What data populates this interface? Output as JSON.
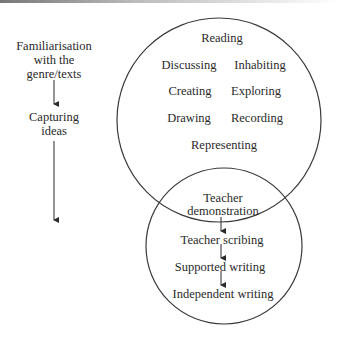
{
  "left_column": {
    "stage1": [
      "Familiarisation",
      "with the",
      "genre/texts"
    ],
    "stage2": [
      "Capturing",
      "ideas"
    ]
  },
  "upper_circle": {
    "items": [
      "Reading",
      "Discussing",
      "Inhabiting",
      "Creating",
      "Exploring",
      "Drawing",
      "Recording",
      "Representing"
    ]
  },
  "lower_circle": {
    "steps": [
      [
        "Teacher",
        "demonstration"
      ],
      "Teacher scribing",
      "Supported writing",
      "Independent writing"
    ]
  },
  "colors": {
    "stroke": "#3a3a3a",
    "text": "#2a2a2a",
    "background": "#ffffff"
  }
}
